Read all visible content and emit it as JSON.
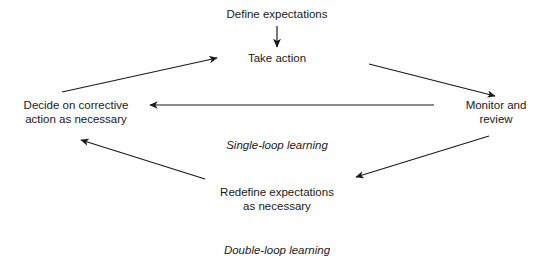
{
  "diagram": {
    "background_color": "#ffffff",
    "line_color": "#1a1a1a",
    "text_color": "#1a1a1a",
    "nodes": [
      {
        "id": "define",
        "label": "Define expectations"
      },
      {
        "id": "take_action",
        "label": "Take action"
      },
      {
        "id": "monitor",
        "label": "Monitor and\nreview"
      },
      {
        "id": "decide",
        "label": "Decide on corrective\naction as necessary"
      },
      {
        "id": "redefine",
        "label": "Redefine expectations\nas necessary"
      }
    ],
    "loop_labels": [
      {
        "id": "single_loop",
        "label": "Single-loop learning"
      },
      {
        "id": "double_loop",
        "label": "Double-loop learning"
      }
    ],
    "connectors": [
      {
        "id": "define-to-take-action",
        "from": "define",
        "to": "take_action",
        "style": "straight-down"
      },
      {
        "id": "take-action-to-monitor",
        "from": "take_action",
        "to": "monitor",
        "style": "diagonal-down-right"
      },
      {
        "id": "monitor-to-decide",
        "from": "monitor",
        "to": "decide",
        "style": "horizontal-left"
      },
      {
        "id": "decide-to-take-action",
        "from": "decide",
        "to": "take_action",
        "style": "diagonal-up-right"
      },
      {
        "id": "monitor-to-redefine",
        "from": "monitor",
        "to": "redefine",
        "style": "diagonal-down-left"
      },
      {
        "id": "redefine-to-decide",
        "from": "redefine",
        "to": "decide",
        "style": "diagonal-up-left"
      }
    ]
  }
}
